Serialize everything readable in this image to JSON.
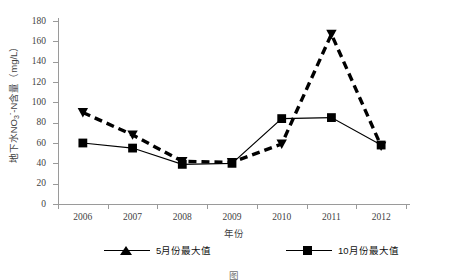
{
  "chart_data": {
    "type": "line",
    "title": "",
    "xlabel": "年份",
    "ylabel": "地下水NO3--N含量（mg/L）",
    "ylabel_parts": {
      "prefix": "地下水NO",
      "sub": "3",
      "sup": "-",
      "suffix": "-N含量（mg/L）"
    },
    "categories": [
      "2006",
      "2007",
      "2008",
      "2009",
      "2010",
      "2011",
      "2012"
    ],
    "x": [
      2006,
      2007,
      2008,
      2009,
      2010,
      2011,
      2012
    ],
    "ylim": [
      0,
      180
    ],
    "yticks": [
      0,
      20,
      40,
      60,
      80,
      100,
      120,
      140,
      160,
      180
    ],
    "grid": false,
    "legend_position": "bottom",
    "series": [
      {
        "name": "5月份最大值",
        "marker": "triangle",
        "linestyle": "dashed",
        "color": "#000000",
        "values": [
          90,
          68,
          42,
          41,
          59,
          167,
          57
        ]
      },
      {
        "name": "10月份最大值",
        "marker": "square",
        "linestyle": "solid",
        "color": "#000000",
        "values": [
          60,
          55,
          39,
          40,
          84,
          85,
          58
        ]
      }
    ]
  },
  "legend": {
    "items": [
      {
        "label": "5月份最大值",
        "marker": "triangle-marker-icon"
      },
      {
        "label": "10月份最大值",
        "marker": "square-marker-icon"
      }
    ]
  },
  "axes": {
    "x_title": "年份",
    "y_tick_labels": [
      "180",
      "160",
      "140",
      "120",
      "100",
      "80",
      "60",
      "40",
      "20",
      "0"
    ],
    "x_tick_labels": [
      "2006",
      "2007",
      "2008",
      "2009",
      "2010",
      "2011",
      "2012"
    ]
  },
  "caption": {
    "text": "图"
  }
}
